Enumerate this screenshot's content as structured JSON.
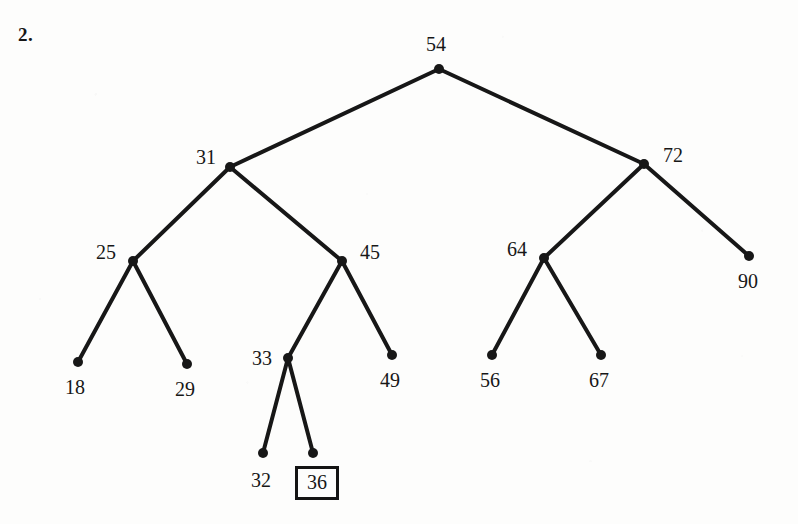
{
  "figure": {
    "problem_number": "2.",
    "type": "binary-tree-diagram",
    "width": 798,
    "height": 524,
    "background_color": "#fdfdfc",
    "ink_color": "#171717",
    "edge_stroke_width": 4,
    "node_radius": 5
  },
  "tree": {
    "root": "54",
    "nodes": [
      {
        "id": "n54",
        "label": "54",
        "x": 439,
        "y": 69,
        "label_x": 426,
        "label_y": 34,
        "label_pos": "above",
        "boxed": false
      },
      {
        "id": "n31",
        "label": "31",
        "x": 230,
        "y": 167,
        "label_x": 196,
        "label_y": 147,
        "label_pos": "left",
        "boxed": false
      },
      {
        "id": "n72",
        "label": "72",
        "x": 644,
        "y": 164,
        "label_x": 663,
        "label_y": 145,
        "label_pos": "right",
        "boxed": false
      },
      {
        "id": "n25",
        "label": "25",
        "x": 133,
        "y": 261,
        "label_x": 96,
        "label_y": 242,
        "label_pos": "left",
        "boxed": false
      },
      {
        "id": "n45",
        "label": "45",
        "x": 342,
        "y": 261,
        "label_x": 360,
        "label_y": 242,
        "label_pos": "right",
        "boxed": false
      },
      {
        "id": "n64",
        "label": "64",
        "x": 544,
        "y": 258,
        "label_x": 507,
        "label_y": 239,
        "label_pos": "left",
        "boxed": false
      },
      {
        "id": "n90",
        "label": "90",
        "x": 749,
        "y": 256,
        "label_x": 738,
        "label_y": 271,
        "label_pos": "below",
        "boxed": false
      },
      {
        "id": "n18",
        "label": "18",
        "x": 78,
        "y": 362,
        "label_x": 65,
        "label_y": 377,
        "label_pos": "below",
        "boxed": false
      },
      {
        "id": "n29",
        "label": "29",
        "x": 187,
        "y": 364,
        "label_x": 175,
        "label_y": 379,
        "label_pos": "below",
        "boxed": false
      },
      {
        "id": "n33",
        "label": "33",
        "x": 288,
        "y": 358,
        "label_x": 252,
        "label_y": 348,
        "label_pos": "left",
        "boxed": false
      },
      {
        "id": "n49",
        "label": "49",
        "x": 392,
        "y": 355,
        "label_x": 380,
        "label_y": 370,
        "label_pos": "below",
        "boxed": false
      },
      {
        "id": "n56",
        "label": "56",
        "x": 492,
        "y": 355,
        "label_x": 480,
        "label_y": 370,
        "label_pos": "below",
        "boxed": false
      },
      {
        "id": "n67",
        "label": "67",
        "x": 601,
        "y": 355,
        "label_x": 589,
        "label_y": 370,
        "label_pos": "below",
        "boxed": false
      },
      {
        "id": "n32",
        "label": "32",
        "x": 263,
        "y": 453,
        "label_x": 251,
        "label_y": 470,
        "label_pos": "below",
        "boxed": false
      },
      {
        "id": "n36",
        "label": "36",
        "x": 313,
        "y": 453,
        "label_x": 295,
        "label_y": 466,
        "label_pos": "below",
        "boxed": true
      }
    ],
    "edges": [
      {
        "from": "n54",
        "to": "n31",
        "x1": 439,
        "y1": 69,
        "x2": 230,
        "y2": 167
      },
      {
        "from": "n54",
        "to": "n72",
        "x1": 439,
        "y1": 69,
        "x2": 644,
        "y2": 164
      },
      {
        "from": "n31",
        "to": "n25",
        "x1": 230,
        "y1": 167,
        "x2": 133,
        "y2": 261
      },
      {
        "from": "n31",
        "to": "n45",
        "x1": 230,
        "y1": 167,
        "x2": 342,
        "y2": 261
      },
      {
        "from": "n72",
        "to": "n64",
        "x1": 644,
        "y1": 164,
        "x2": 544,
        "y2": 258
      },
      {
        "from": "n72",
        "to": "n90",
        "x1": 644,
        "y1": 164,
        "x2": 749,
        "y2": 256
      },
      {
        "from": "n25",
        "to": "n18",
        "x1": 133,
        "y1": 261,
        "x2": 78,
        "y2": 362
      },
      {
        "from": "n25",
        "to": "n29",
        "x1": 133,
        "y1": 261,
        "x2": 187,
        "y2": 364
      },
      {
        "from": "n45",
        "to": "n33",
        "x1": 342,
        "y1": 261,
        "x2": 288,
        "y2": 358
      },
      {
        "from": "n45",
        "to": "n49",
        "x1": 342,
        "y1": 261,
        "x2": 392,
        "y2": 355
      },
      {
        "from": "n64",
        "to": "n56",
        "x1": 544,
        "y1": 258,
        "x2": 492,
        "y2": 355
      },
      {
        "from": "n64",
        "to": "n67",
        "x1": 544,
        "y1": 258,
        "x2": 601,
        "y2": 355
      },
      {
        "from": "n33",
        "to": "n32",
        "x1": 288,
        "y1": 358,
        "x2": 263,
        "y2": 453
      },
      {
        "from": "n33",
        "to": "n36",
        "x1": 288,
        "y1": 358,
        "x2": 313,
        "y2": 453
      }
    ],
    "highlighted_node": "36"
  }
}
